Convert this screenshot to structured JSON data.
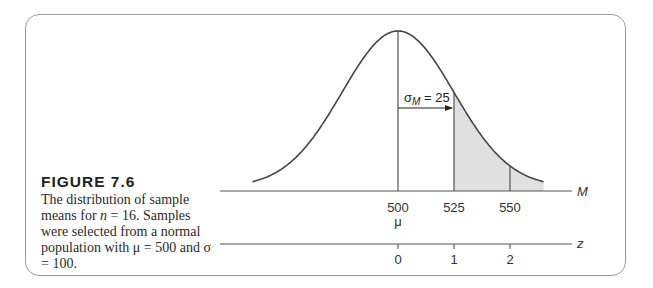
{
  "figure": {
    "label": "FIGURE 7.6",
    "caption_parts": {
      "p1": "The distribution of sample means for ",
      "n_var": "n",
      "p2": " = 16. Samples were selected from a normal population with ",
      "mu_sym": "μ",
      "p3": " = 500 and ",
      "sigma_sym": "σ",
      "p4": " = 100."
    }
  },
  "chart_data": {
    "type": "area",
    "distribution": {
      "kind": "normal",
      "mean": 500,
      "std_error": 25
    },
    "x_axis": {
      "label": "M",
      "ticks": [
        500,
        525,
        550
      ],
      "tick_labels": [
        "500",
        "525",
        "550"
      ],
      "mean_marker": "μ"
    },
    "z_axis": {
      "label": "z",
      "ticks": [
        0,
        1,
        2
      ],
      "tick_labels": [
        "0",
        "1",
        "2"
      ]
    },
    "annotations": [
      {
        "text": "σM = 25",
        "symbol": "σ",
        "subscript": "M",
        "value": "= 25",
        "arrow_from": 500,
        "arrow_to": 525
      }
    ],
    "shaded_region": {
      "from": 525,
      "to": "right tail",
      "color": "#e0e0e0"
    },
    "vertical_lines": [
      500,
      525,
      550
    ],
    "grid": false,
    "legend": null
  }
}
